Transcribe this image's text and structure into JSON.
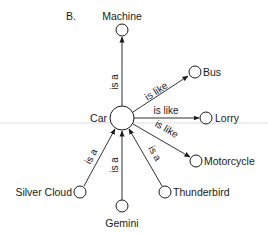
{
  "panel_label": "B.",
  "central_node": {
    "label": "Car"
  },
  "nodes": {
    "machine": {
      "label": "Machine"
    },
    "bus": {
      "label": "Bus"
    },
    "lorry": {
      "label": "Lorry"
    },
    "motorcycle": {
      "label": "Motorcycle"
    },
    "silver_cloud": {
      "label": "Silver Cloud"
    },
    "gemini": {
      "label": "Gemini"
    },
    "thunderbird": {
      "label": "Thunderbird"
    }
  },
  "edges": {
    "car_machine": {
      "label": "is a"
    },
    "car_bus": {
      "label": "is like"
    },
    "car_lorry": {
      "label": "is like"
    },
    "car_motorcycle": {
      "label": "is like"
    },
    "silver_cloud_car": {
      "label": "is a"
    },
    "gemini_car": {
      "label": "is a"
    },
    "thunderbird_car": {
      "label": "is a"
    }
  },
  "colors": {
    "stroke": "#1a1a1a",
    "background": "#ffffff",
    "scan_line": "#d6d6d6"
  }
}
